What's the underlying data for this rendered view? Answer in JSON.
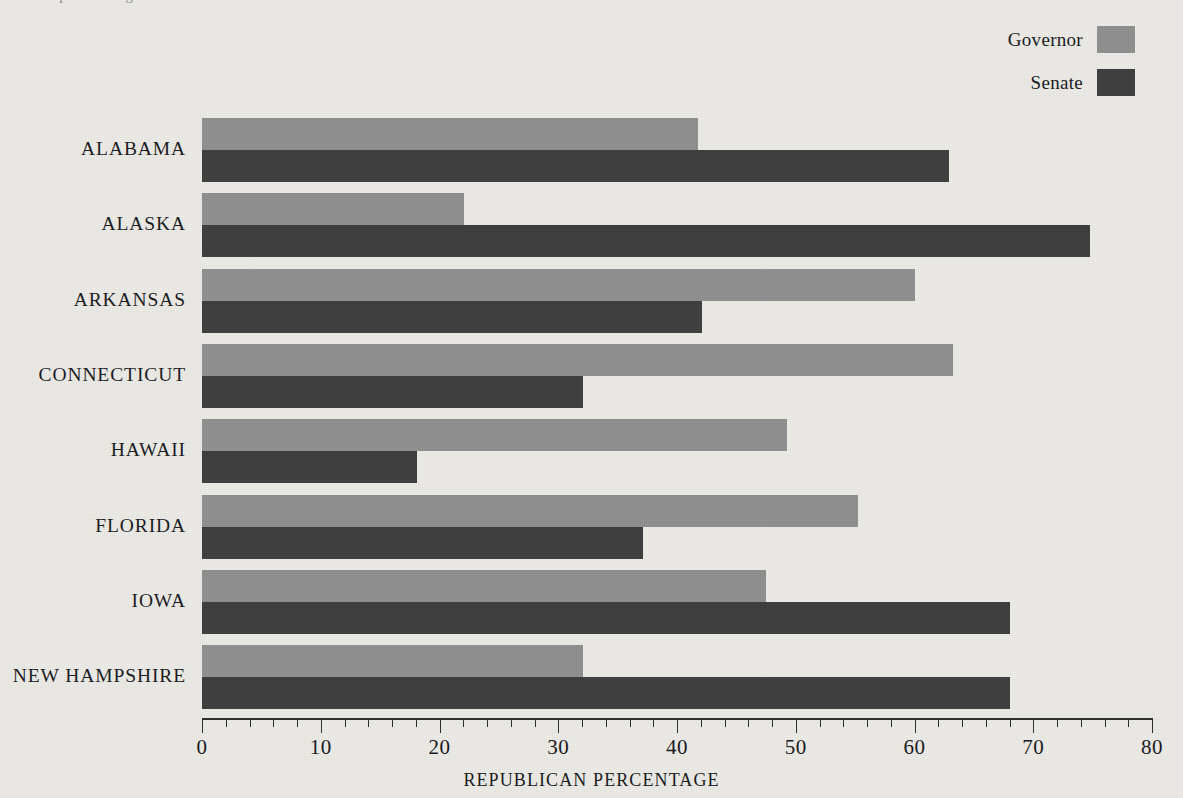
{
  "page": {
    "bleed_text": "a comparison of gubernatorial and senatorial returns",
    "background_color": "#eceae5"
  },
  "legend": {
    "position": "top-right",
    "entries": [
      {
        "label": "Governor",
        "color": "#8e8e8e",
        "swatch_name": "legend-swatch-governor"
      },
      {
        "label": "Senate",
        "color": "#3b3b3b",
        "swatch_name": "legend-swatch-senate"
      }
    ]
  },
  "axis": {
    "label": "REPUBLICAN PERCENTAGE",
    "ticks": [
      0,
      10,
      20,
      30,
      40,
      50,
      60,
      70,
      80
    ],
    "minor_step": 2,
    "min": 0,
    "max": 80
  },
  "chart_data": {
    "type": "bar",
    "orientation": "horizontal",
    "title": "",
    "xlabel": "REPUBLICAN PERCENTAGE",
    "ylabel": "",
    "xlim": [
      0,
      80
    ],
    "grid": false,
    "legend_position": "top-right",
    "categories": [
      "ALABAMA",
      "ALASKA",
      "ARKANSAS",
      "CONNECTICUT",
      "HAWAII",
      "FLORIDA",
      "IOWA",
      "NEW HAMPSHIRE"
    ],
    "series": [
      {
        "name": "Governor",
        "color": "#8e8e8e",
        "values": [
          41.8,
          22.1,
          60.0,
          63.2,
          49.3,
          55.2,
          47.5,
          32.1
        ]
      },
      {
        "name": "Senate",
        "color": "#3b3b3b",
        "values": [
          62.9,
          74.8,
          42.1,
          32.1,
          18.1,
          37.1,
          68.0,
          68.0
        ]
      }
    ]
  }
}
